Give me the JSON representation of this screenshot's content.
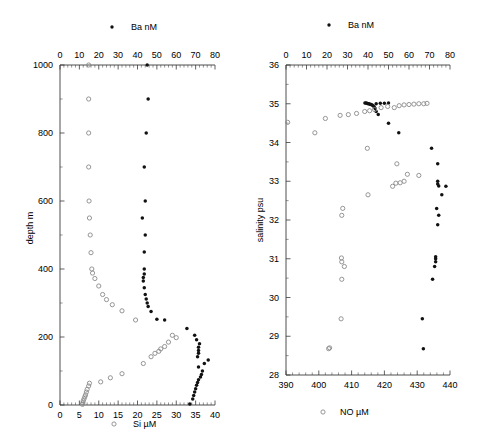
{
  "figure": {
    "background": "#ffffff",
    "width": 478,
    "height": 437
  },
  "chart_data": [
    {
      "id": "depth-profile",
      "type": "scatter",
      "title": "",
      "xlabel": "Si µM",
      "ylabel": "depth m",
      "top_axis_label": "Ba nM",
      "xlim": [
        0,
        40
      ],
      "ylim": [
        1000,
        0
      ],
      "top_xlim": [
        0,
        80
      ],
      "y_inverted": true,
      "grid": false,
      "legend_position": "top-center-and-bottom-center",
      "xticks": [
        0,
        5,
        10,
        15,
        20,
        25,
        30,
        35,
        40
      ],
      "yticks": [
        0,
        200,
        400,
        600,
        800,
        1000
      ],
      "top_xticks": [
        0,
        10,
        20,
        30,
        40,
        50,
        60,
        70,
        80
      ],
      "series": [
        {
          "name": "Ba nM",
          "marker": "filled-circle",
          "color": "#111111",
          "axis": "top",
          "points": [
            [
              67.0,
              3
            ],
            [
              68.5,
              18
            ],
            [
              69.0,
              28
            ],
            [
              69.5,
              38
            ],
            [
              70.0,
              48
            ],
            [
              70.5,
              58
            ],
            [
              71.0,
              66
            ],
            [
              71.5,
              74
            ],
            [
              72.5,
              82
            ],
            [
              73.0,
              90
            ],
            [
              73.5,
              100
            ],
            [
              71.5,
              112
            ],
            [
              74.5,
              122
            ],
            [
              76.5,
              132
            ],
            [
              71.0,
              142
            ],
            [
              71.5,
              152
            ],
            [
              71.5,
              160
            ],
            [
              71.5,
              170
            ],
            [
              72.0,
              180
            ],
            [
              70.5,
              192
            ],
            [
              69.5,
              205
            ],
            [
              65.5,
              225
            ],
            [
              54.0,
              250
            ],
            [
              50.0,
              252
            ],
            [
              47.0,
              275
            ],
            [
              45.5,
              290
            ],
            [
              45.0,
              300
            ],
            [
              44.5,
              312
            ],
            [
              44.0,
              325
            ],
            [
              43.5,
              345
            ],
            [
              43.0,
              365
            ],
            [
              43.0,
              375
            ],
            [
              43.5,
              385
            ],
            [
              43.5,
              400
            ],
            [
              43.5,
              450
            ],
            [
              44.0,
              500
            ],
            [
              42.5,
              550
            ],
            [
              44.0,
              600
            ],
            [
              43.5,
              700
            ],
            [
              44.5,
              800
            ],
            [
              45.5,
              900
            ],
            [
              45.0,
              1000
            ]
          ]
        },
        {
          "name": "Si µM",
          "marker": "open-circle",
          "color": "#8a8a8a",
          "axis": "bottom",
          "points": [
            [
              5.8,
              2
            ],
            [
              5.9,
              6
            ],
            [
              6.0,
              12
            ],
            [
              6.2,
              18
            ],
            [
              6.4,
              24
            ],
            [
              6.6,
              30
            ],
            [
              6.8,
              38
            ],
            [
              7.0,
              46
            ],
            [
              7.4,
              56
            ],
            [
              7.6,
              64
            ],
            [
              10.5,
              68
            ],
            [
              13.0,
              80
            ],
            [
              16.0,
              92
            ],
            [
              21.5,
              122
            ],
            [
              23.5,
              142
            ],
            [
              24.5,
              152
            ],
            [
              25.5,
              158
            ],
            [
              26.0,
              165
            ],
            [
              27.0,
              172
            ],
            [
              28.0,
              185
            ],
            [
              30.0,
              198
            ],
            [
              29.0,
              205
            ],
            [
              19.5,
              250
            ],
            [
              16.0,
              277
            ],
            [
              13.5,
              295
            ],
            [
              12.0,
              310
            ],
            [
              11.0,
              325
            ],
            [
              10.0,
              350
            ],
            [
              9.0,
              372
            ],
            [
              8.4,
              388
            ],
            [
              8.2,
              400
            ],
            [
              8.0,
              448
            ],
            [
              7.8,
              500
            ],
            [
              7.6,
              550
            ],
            [
              7.5,
              600
            ],
            [
              7.4,
              700
            ],
            [
              7.4,
              800
            ],
            [
              7.4,
              900
            ],
            [
              7.4,
              1000
            ]
          ]
        }
      ]
    },
    {
      "id": "salinity-property-plot",
      "type": "scatter",
      "title": "",
      "xlabel": "NO µM",
      "ylabel": "salinity psu",
      "top_axis_label": "Ba nM",
      "xlim": [
        390,
        440
      ],
      "ylim": [
        36,
        28
      ],
      "top_xlim": [
        0,
        80
      ],
      "y_inverted": true,
      "grid": false,
      "legend_position": "top-center-and-bottom-center",
      "xticks": [
        390,
        400,
        410,
        420,
        430,
        440
      ],
      "yticks": [
        28,
        29,
        30,
        31,
        32,
        33,
        34,
        35,
        36
      ],
      "top_xticks": [
        0,
        10,
        20,
        30,
        40,
        50,
        60,
        70,
        80
      ],
      "series": [
        {
          "name": "Ba nM",
          "marker": "filled-circle",
          "color": "#111111",
          "axis": "top",
          "points": [
            [
              67.0,
              28.68
            ],
            [
              66.5,
              29.45
            ],
            [
              71.5,
              30.47
            ],
            [
              72.5,
              30.8
            ],
            [
              73.0,
              30.92
            ],
            [
              73.0,
              31.0
            ],
            [
              73.0,
              31.05
            ],
            [
              74.0,
              31.88
            ],
            [
              74.5,
              32.12
            ],
            [
              73.5,
              32.3
            ],
            [
              76.0,
              32.65
            ],
            [
              74.5,
              32.88
            ],
            [
              74.0,
              32.93
            ],
            [
              74.0,
              33.0
            ],
            [
              78.0,
              32.87
            ],
            [
              74.0,
              33.45
            ],
            [
              71.0,
              33.85
            ],
            [
              55.0,
              34.25
            ],
            [
              50.0,
              34.5
            ],
            [
              45.0,
              34.72
            ],
            [
              44.0,
              34.8
            ],
            [
              43.5,
              34.88
            ],
            [
              43.0,
              34.92
            ],
            [
              42.5,
              34.95
            ],
            [
              42.0,
              34.97
            ],
            [
              41.5,
              34.98
            ],
            [
              41.0,
              34.99
            ],
            [
              40.5,
              35.0
            ],
            [
              40.0,
              35.0
            ],
            [
              39.5,
              35.01
            ],
            [
              39.0,
              35.02
            ],
            [
              38.5,
              35.02
            ],
            [
              44.0,
              35.0
            ],
            [
              46.0,
              35.01
            ],
            [
              48.0,
              35.01
            ],
            [
              50.0,
              35.02
            ]
          ]
        },
        {
          "name": "NO µM",
          "marker": "open-circle",
          "color": "#8a8a8a",
          "axis": "bottom",
          "points": [
            [
              403.0,
              28.68
            ],
            [
              403.3,
              28.7
            ],
            [
              406.8,
              29.45
            ],
            [
              407.0,
              30.47
            ],
            [
              407.8,
              30.8
            ],
            [
              407.0,
              30.92
            ],
            [
              406.9,
              31.02
            ],
            [
              407.0,
              32.12
            ],
            [
              407.3,
              32.3
            ],
            [
              415.0,
              32.65
            ],
            [
              422.5,
              32.87
            ],
            [
              423.5,
              32.95
            ],
            [
              424.8,
              32.96
            ],
            [
              426.0,
              33.0
            ],
            [
              427.0,
              33.18
            ],
            [
              430.5,
              33.15
            ],
            [
              423.8,
              33.45
            ],
            [
              414.8,
              33.85
            ],
            [
              390.5,
              34.52
            ],
            [
              398.8,
              34.25
            ],
            [
              402.0,
              34.62
            ],
            [
              406.5,
              34.7
            ],
            [
              409.0,
              34.72
            ],
            [
              411.5,
              34.75
            ],
            [
              414.0,
              34.8
            ],
            [
              415.5,
              34.82
            ],
            [
              417.0,
              34.85
            ],
            [
              419.0,
              34.9
            ],
            [
              421.0,
              34.93
            ],
            [
              423.0,
              34.9
            ],
            [
              424.5,
              34.95
            ],
            [
              426.0,
              34.97
            ],
            [
              427.5,
              34.98
            ],
            [
              429.0,
              34.99
            ],
            [
              430.5,
              35.0
            ],
            [
              432.0,
              35.0
            ],
            [
              433.0,
              35.01
            ]
          ]
        }
      ]
    }
  ],
  "panels": {
    "left": {
      "top_legend": {
        "label": "Ba nM",
        "marker": "filled-circle"
      },
      "bottom_legend": {
        "label": "Si µM",
        "marker": "open-circle"
      },
      "y_axis_title": "depth m",
      "top_tick_labels": [
        "0",
        "10",
        "20",
        "30",
        "40",
        "50",
        "60",
        "70",
        "80"
      ],
      "bottom_tick_labels": [
        "0",
        "5",
        "10",
        "15",
        "20",
        "25",
        "30",
        "35",
        "40"
      ],
      "y_tick_labels": [
        "0",
        "200",
        "400",
        "600",
        "800",
        "1000"
      ]
    },
    "right": {
      "top_legend": {
        "label": "Ba nM",
        "marker": "filled-circle"
      },
      "bottom_legend": {
        "label": "NO µM",
        "marker": "open-circle"
      },
      "y_axis_title": "salinity psu",
      "top_tick_labels": [
        "0",
        "10",
        "20",
        "30",
        "40",
        "50",
        "60",
        "70",
        "80"
      ],
      "bottom_tick_labels": [
        "390",
        "400",
        "410",
        "420",
        "430",
        "440"
      ],
      "y_tick_labels": [
        "28",
        "29",
        "30",
        "31",
        "32",
        "33",
        "34",
        "35",
        "36"
      ]
    }
  }
}
